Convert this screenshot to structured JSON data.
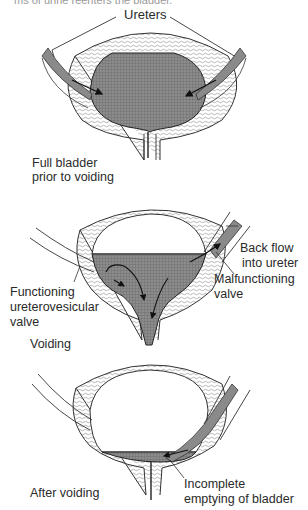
{
  "caption_fragment": "ms of urine reenters the bladder.",
  "colors": {
    "urine_fill": "#8a8a8a",
    "wall_line": "#333333",
    "background": "#ffffff"
  },
  "panels": [
    {
      "id": "full-bladder",
      "labels": {
        "ureters": "Ureters",
        "state_line1": "Full bladder",
        "state_line2": "prior to voiding"
      }
    },
    {
      "id": "voiding",
      "labels": {
        "back_flow_line1": "Back flow",
        "back_flow_line2": "into ureter",
        "malfunctioning_line1": "Malfunctioning",
        "malfunctioning_line2": "valve",
        "functioning_line1": "Functioning",
        "functioning_line2": "ureterovesicular",
        "functioning_line3": "valve",
        "state": "Voiding"
      }
    },
    {
      "id": "after-voiding",
      "labels": {
        "state": "After voiding",
        "incomplete_line1": "Incomplete",
        "incomplete_line2": "emptying of bladder"
      }
    }
  ]
}
